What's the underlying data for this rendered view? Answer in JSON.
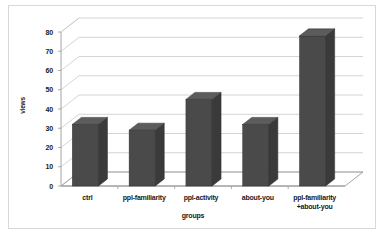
{
  "chart_data": {
    "type": "bar",
    "title": "",
    "subtitle": "",
    "xlabel": "groups",
    "ylabel": "views",
    "categories": [
      "ctrl",
      "ppl-familiarity",
      "ppl-activity",
      "about-you",
      "ppl-familiarity\n+about-you"
    ],
    "values": [
      32,
      29,
      45,
      32,
      78
    ],
    "ylim": [
      0,
      80
    ],
    "ytick_values": [
      0,
      10,
      20,
      30,
      40,
      50,
      60,
      70,
      80
    ],
    "ytick_labels": [
      "0",
      "10",
      "20",
      "30",
      "40",
      "50",
      "60",
      "70",
      "80"
    ],
    "grid": true,
    "legend": false,
    "style": "3d-column",
    "series": [
      {
        "name": "views",
        "values": [
          32,
          29,
          45,
          32,
          78
        ]
      }
    ],
    "colors": {
      "bar_front": "#4a4a4a",
      "bar_side": "#3a3a3a",
      "bar_top": "#5c5c5c",
      "gridline": "#c9c9c9",
      "axis": "#9a9a9a",
      "frame_border": "#d8d8d8",
      "background": "#ffffff",
      "text": "#1a1a1a"
    }
  }
}
